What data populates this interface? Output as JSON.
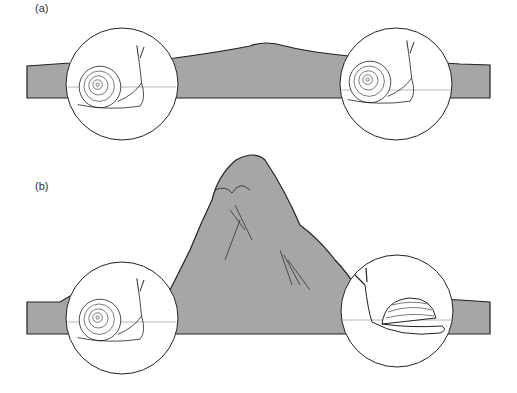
{
  "figure": {
    "panels": [
      {
        "label": "(a)",
        "description": "Two populations of round-shelled snails separated by a low hill; gene flow possible",
        "left_snail": "round-shell-snail",
        "right_snail": "round-shell-snail",
        "barrier": "low-hill"
      },
      {
        "label": "(b)",
        "description": "Populations separated by a tall mountain; right population has diverged into a flat, domed-shell snail",
        "left_snail": "round-shell-snail",
        "right_snail": "flat-domed-shell-snail",
        "barrier": "tall-mountain"
      }
    ],
    "colors": {
      "terrain_fill": "#a6a6a6",
      "outline": "#222222",
      "background": "#ffffff",
      "circle_fill": "#ffffff"
    }
  }
}
